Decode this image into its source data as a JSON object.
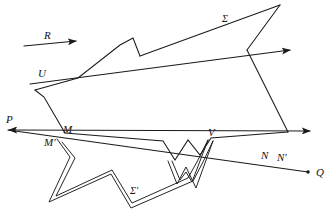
{
  "figure": {
    "type": "geometric-diagram",
    "width": 332,
    "height": 224,
    "background_color": "#ffffff",
    "stroke_color": "#1a1a1a",
    "labels": [
      {
        "id": "R",
        "text": "R",
        "x": 44,
        "y": 30,
        "role": "direction-vector-label"
      },
      {
        "id": "Sigma",
        "text": "Σ",
        "x": 222,
        "y": 14,
        "role": "surface-label"
      },
      {
        "id": "U",
        "text": "U",
        "x": 38,
        "y": 68,
        "role": "point-label"
      },
      {
        "id": "P",
        "text": "P",
        "x": 6,
        "y": 114,
        "role": "ray-endpoint-label"
      },
      {
        "id": "M",
        "text": "M",
        "x": 63,
        "y": 124,
        "role": "point-label"
      },
      {
        "id": "Mprime",
        "text": "M′",
        "x": 44,
        "y": 137,
        "role": "image-point-label"
      },
      {
        "id": "V",
        "text": "V",
        "x": 208,
        "y": 127,
        "role": "point-label"
      },
      {
        "id": "N",
        "text": "N",
        "x": 261,
        "y": 150,
        "role": "point-label"
      },
      {
        "id": "Nprime",
        "text": "N′",
        "x": 277,
        "y": 152,
        "role": "image-point-label"
      },
      {
        "id": "Q",
        "text": "Q",
        "x": 316,
        "y": 167,
        "role": "ray-endpoint-label"
      },
      {
        "id": "SigmaP",
        "text": "Σ′",
        "x": 130,
        "y": 186,
        "role": "image-surface-label"
      }
    ],
    "rays": [
      {
        "id": "ray-R",
        "name": "direction-arrow-R",
        "from": [
          24,
          46
        ],
        "to": [
          78,
          41
        ],
        "arrow_at": "end"
      },
      {
        "id": "ray-U",
        "name": "ray-through-U",
        "from": [
          30,
          84
        ],
        "to": [
          294,
          50
        ],
        "arrow_at": "end"
      },
      {
        "id": "ray-PQ-upper",
        "name": "ray-P-to-right",
        "from": [
          6,
          130
        ],
        "to": [
          314,
          131
        ],
        "arrow_at": "both"
      },
      {
        "id": "ray-PQ-lower",
        "name": "ray-M-to-Q",
        "from": [
          6,
          130
        ],
        "to": [
          311,
          172
        ],
        "arrow_at": "end"
      }
    ],
    "polygon_sigma": {
      "name": "surface-sigma-outline",
      "points": "78,78 120,45 133,38 140,55 160,72 280,5 247,50 288,132 211,138 200,155 188,140 175,160 163,141 65,133 44,97 35,90"
    },
    "polygon_sigma_prime": {
      "name": "surface-sigma-prime-outline",
      "points": "58,140 70,156 50,201 110,175 130,207 190,182 200,160 210,140 213,143 203,163 195,187 186,167 178,183 170,163 168,160"
    }
  }
}
